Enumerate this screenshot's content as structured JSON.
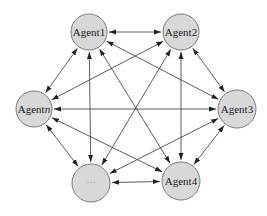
{
  "diagram": {
    "type": "fully-connected multi-agent network",
    "style": {
      "node_fill": "#d8d8d8",
      "node_stroke": "#7a7a7a",
      "edge_color": "#333333",
      "background": "#ffffff"
    },
    "nodes": [
      {
        "id": "agent1",
        "label": "Agent1",
        "label_base": "Agent",
        "label_suffix": "1",
        "cx": 89,
        "cy": 32,
        "r": 18
      },
      {
        "id": "agent2",
        "label": "Agent2",
        "label_base": "Agent",
        "label_suffix": "2",
        "cx": 181,
        "cy": 32,
        "r": 18
      },
      {
        "id": "agent3",
        "label": "Agent3",
        "label_base": "Agent",
        "label_suffix": "3",
        "cx": 237,
        "cy": 109,
        "r": 19
      },
      {
        "id": "agent4",
        "label": "Agent4",
        "label_base": "Agent",
        "label_suffix": "4",
        "cx": 181,
        "cy": 181,
        "r": 19
      },
      {
        "id": "ellipsis",
        "label": "···",
        "label_base": "···",
        "label_suffix": "",
        "cx": 91,
        "cy": 183,
        "r": 19
      },
      {
        "id": "agentn",
        "label": "Agentn",
        "label_base": "Agent",
        "label_suffix": "n",
        "cx": 34,
        "cy": 109,
        "r": 18
      }
    ],
    "edges": [
      {
        "from": "agent1",
        "to": "agent2",
        "bidirectional": true
      },
      {
        "from": "agent2",
        "to": "agent3",
        "bidirectional": true
      },
      {
        "from": "agent3",
        "to": "agent4",
        "bidirectional": true
      },
      {
        "from": "agent4",
        "to": "ellipsis",
        "bidirectional": true
      },
      {
        "from": "ellipsis",
        "to": "agentn",
        "bidirectional": true
      },
      {
        "from": "agentn",
        "to": "agent1",
        "bidirectional": true
      },
      {
        "from": "agent1",
        "to": "agent3",
        "bidirectional": true
      },
      {
        "from": "agent1",
        "to": "agent4",
        "bidirectional": true
      },
      {
        "from": "agent1",
        "to": "ellipsis",
        "bidirectional": true
      },
      {
        "from": "agent2",
        "to": "agent4",
        "bidirectional": true
      },
      {
        "from": "agent2",
        "to": "ellipsis",
        "bidirectional": true
      },
      {
        "from": "agent2",
        "to": "agentn",
        "bidirectional": true
      },
      {
        "from": "agent3",
        "to": "ellipsis",
        "bidirectional": true
      },
      {
        "from": "agent3",
        "to": "agentn",
        "bidirectional": true
      },
      {
        "from": "agent4",
        "to": "agentn",
        "bidirectional": true
      }
    ]
  }
}
